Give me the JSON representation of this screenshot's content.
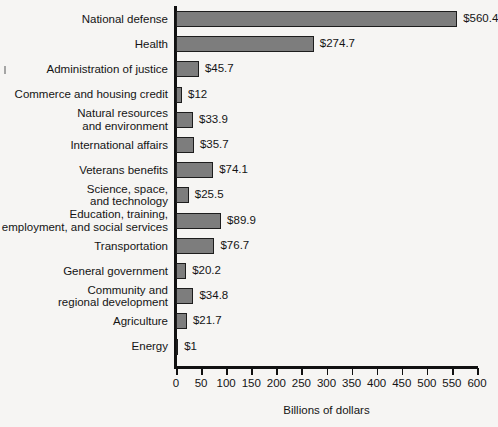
{
  "chart_data": {
    "type": "bar",
    "orientation": "horizontal",
    "title": "",
    "xlabel": "Billions of dollars",
    "ylabel": "",
    "xlim": [
      0,
      600
    ],
    "xticks": [
      0,
      50,
      100,
      150,
      200,
      250,
      300,
      350,
      400,
      450,
      500,
      550,
      600
    ],
    "xtick_labels": [
      "0",
      "50",
      "100",
      "150",
      "200",
      "250",
      "300",
      "350",
      "400",
      "450",
      "500",
      "550",
      "600"
    ],
    "grid": false,
    "legend": null,
    "bar_color": "#7d7d7d",
    "bar_edge_color": "#1d1d1d",
    "categories": [
      "National defense",
      "Health",
      "Administration of justice",
      "Commerce and housing credit",
      "Natural resources\nand environment",
      "International affairs",
      "Veterans benefits",
      "Science, space,\nand technology",
      "Education, training,\nemployment, and social services",
      "Transportation",
      "General government",
      "Community and\nregional development",
      "Agriculture",
      "Energy"
    ],
    "values": [
      560.4,
      274.7,
      45.7,
      12,
      33.9,
      35.7,
      74.1,
      25.5,
      89.9,
      76.7,
      20.2,
      34.8,
      21.7,
      1
    ],
    "data_labels": [
      "$560.4",
      "$274.7",
      "$45.7",
      "$12",
      "$33.9",
      "$35.7",
      "$74.1",
      "$25.5",
      "$89.9",
      "$76.7",
      "$20.2",
      "$34.8",
      "$21.7",
      "$1"
    ]
  }
}
